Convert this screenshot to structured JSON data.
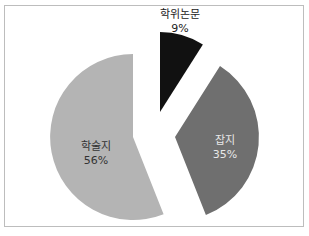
{
  "chart_data": {
    "type": "pie",
    "title": "",
    "exploded": true,
    "start_angle_deg": 0,
    "direction": "clockwise",
    "categories": [
      "학위논문",
      "잡지",
      "학술지"
    ],
    "values": [
      9,
      35,
      56
    ],
    "unit": "%",
    "colors": [
      "#111111",
      "#6f6f6f",
      "#b4b4b4"
    ],
    "label_colors": [
      "#222222",
      "#e8e8e8",
      "#333333"
    ],
    "slices": [
      {
        "name": "학위논문",
        "value": 9,
        "label": "학위논문",
        "pct": "9%"
      },
      {
        "name": "잡지",
        "value": 35,
        "label": "잡지",
        "pct": "35%"
      },
      {
        "name": "학술지",
        "value": 56,
        "label": "학술지",
        "pct": "56%"
      }
    ],
    "legend": "none"
  }
}
